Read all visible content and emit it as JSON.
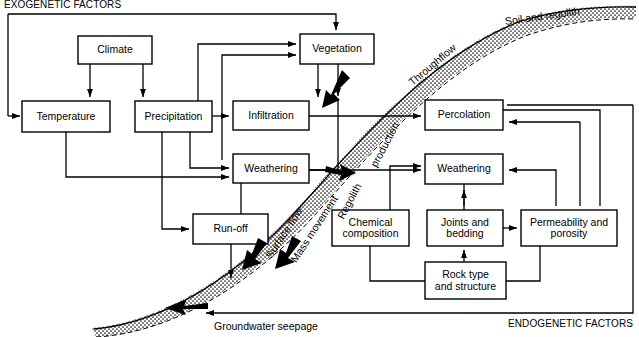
{
  "figure": {
    "exogenetic_label": "EXOGENETIC FACTORS",
    "endogenetic_label": "ENDOGENETIC FACTORS"
  },
  "boxes": [
    {
      "id": "climate",
      "label": "Climate",
      "x": 78,
      "y": 36,
      "w": 74,
      "h": 28
    },
    {
      "id": "temperature",
      "label": "Temperature",
      "x": 22,
      "y": 101,
      "w": 88,
      "h": 31
    },
    {
      "id": "precipitation",
      "label": "Precipitation",
      "x": 135,
      "y": 101,
      "w": 77,
      "h": 31
    },
    {
      "id": "infiltration",
      "label": "Infiltration",
      "x": 233,
      "y": 101,
      "w": 76,
      "h": 29
    },
    {
      "id": "vegetation",
      "label": "Vegetation",
      "x": 300,
      "y": 34,
      "w": 74,
      "h": 30
    },
    {
      "id": "weathering_l",
      "label": "Weathering",
      "x": 233,
      "y": 154,
      "w": 76,
      "h": 29
    },
    {
      "id": "runoff",
      "label": "Run-off",
      "x": 193,
      "y": 214,
      "w": 75,
      "h": 30
    },
    {
      "id": "percolation",
      "label": "Percolation",
      "x": 425,
      "y": 100,
      "w": 78,
      "h": 30
    },
    {
      "id": "weathering_r",
      "label": "Weathering",
      "x": 425,
      "y": 154,
      "w": 78,
      "h": 30
    },
    {
      "id": "chemical",
      "label": "Chemical\ncomposition",
      "x": 332,
      "y": 210,
      "w": 77,
      "h": 36
    },
    {
      "id": "joints",
      "label": "Joints and\nbedding",
      "x": 427,
      "y": 210,
      "w": 76,
      "h": 36
    },
    {
      "id": "permeability",
      "label": "Permeability and\nporosity",
      "x": 521,
      "y": 210,
      "w": 96,
      "h": 36
    },
    {
      "id": "rocktype",
      "label": "Rock type\nand structure",
      "x": 425,
      "y": 262,
      "w": 81,
      "h": 37
    }
  ],
  "band_labels": [
    {
      "id": "soil-and-regolith",
      "text": "Soil and regolith",
      "x": 505,
      "y": 15,
      "rotate": -8
    },
    {
      "id": "throughflow",
      "text": "Throughflow",
      "x": 410,
      "y": 77,
      "rotate": -40
    },
    {
      "id": "regolith-production",
      "text": "production",
      "x": 373,
      "y": 160,
      "rotate": -62
    },
    {
      "id": "regolith",
      "text": "Regolith",
      "x": 340,
      "y": 212,
      "rotate": -62
    },
    {
      "id": "mass-movement",
      "text": "Mass movement",
      "x": 293,
      "y": 255,
      "rotate": -57
    },
    {
      "id": "surface-flow",
      "text": "Surface flow",
      "x": 268,
      "y": 251,
      "rotate": -57
    }
  ],
  "flat_labels": [
    {
      "id": "groundwater-seepage",
      "text": "Groundwater seepage",
      "x": 214,
      "y": 320
    }
  ],
  "colors": {
    "line": "#000000",
    "fill": "#ffffff",
    "stipple": "#000000",
    "background": "#ffffff"
  }
}
